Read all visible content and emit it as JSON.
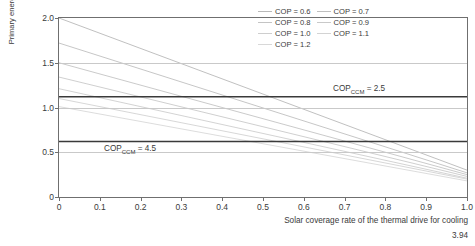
{
  "chart_data": {
    "type": "line",
    "title": "",
    "xlabel": "Solar coverage rate of the thermal drive for cooling",
    "ylabel": "Primary energy expenditure per unit of useful cold kWh/kWh",
    "xlim": [
      0,
      1.0
    ],
    "ylim": [
      0,
      2.0
    ],
    "xticks": [
      "0",
      "0.1",
      "0.2",
      "0.3",
      "0.4",
      "0.5",
      "0.6",
      "0.7",
      "0.8",
      "0.9",
      "1.0"
    ],
    "xtick_values": [
      0,
      0.1,
      0.2,
      0.3,
      0.4,
      0.5,
      0.6,
      0.7,
      0.8,
      0.9,
      1.0
    ],
    "yticks": [
      "0",
      "0.5",
      "1.0",
      "1.5",
      "2.0"
    ],
    "ytick_values": [
      0,
      0.5,
      1.0,
      1.5,
      2.0
    ],
    "grid": true,
    "legend_position": "top-right",
    "x": [
      0,
      1.0
    ],
    "series": [
      {
        "name": "COP = 0.6",
        "values": [
          2.0,
          0.3
        ],
        "color": "#b9b9b9"
      },
      {
        "name": "COP = 0.7",
        "values": [
          1.72,
          0.27
        ],
        "color": "#bfbfbf"
      },
      {
        "name": "COP = 0.8",
        "values": [
          1.5,
          0.25
        ],
        "color": "#c4c4c4"
      },
      {
        "name": "COP = 0.9",
        "values": [
          1.34,
          0.23
        ],
        "color": "#c9c9c9"
      },
      {
        "name": "COP = 1.0",
        "values": [
          1.21,
          0.21
        ],
        "color": "#cecece"
      },
      {
        "name": "COP = 1.1",
        "values": [
          1.1,
          0.2
        ],
        "color": "#d3d3d3"
      },
      {
        "name": "COP = 1.2",
        "values": [
          1.01,
          0.18
        ],
        "color": "#d8d8d8"
      }
    ],
    "reference_lines": [
      {
        "label": "COP_CCM = 2.5",
        "label_base": "COP",
        "label_sub": "CCM",
        "label_value": "= 2.5",
        "value": 1.12,
        "color": "#3a3a3a"
      },
      {
        "label": "COP_CCM = 4.5",
        "label_base": "COP",
        "label_sub": "CCM",
        "label_value": "= 4.5",
        "value": 0.62,
        "color": "#3a3a3a"
      }
    ],
    "annotations": [
      {
        "text": "COP_CCM = 2.5",
        "x": 0.72,
        "y": 1.25
      },
      {
        "text": "COP_CCM = 4.5",
        "x": 0.14,
        "y": 0.74
      }
    ]
  },
  "legend": {
    "columns": [
      {
        "items": [
          {
            "label": "COP = 0.6"
          },
          {
            "label": "COP = 0.8"
          },
          {
            "label": "COP = 1.0"
          },
          {
            "label": "COP = 1.2"
          }
        ]
      },
      {
        "items": [
          {
            "label": "COP = 0.7"
          },
          {
            "label": "COP = 0.9"
          },
          {
            "label": "COP = 1.1"
          }
        ]
      }
    ]
  },
  "figure": {
    "number": "3.94",
    "y_axis_title": "Primary energy expenditure per unit of useful cold kWh/kWh",
    "x_axis_title": "Solar coverage rate of the thermal drive for cooling"
  }
}
